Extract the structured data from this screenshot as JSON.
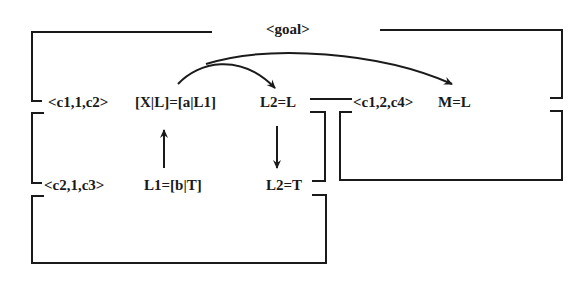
{
  "diagram": {
    "goal_label": "<goal>",
    "row1": {
      "clause1": "<c1,1,c2>",
      "unify1": "[X|L]=[a|L1]",
      "binding1": "L2=L",
      "clause2": "<c1,2,c4>",
      "binding2": "M=L"
    },
    "row2": {
      "clause": "<c2,1,c3>",
      "binding1": "L1=[b|T]",
      "binding2": "L2=T"
    },
    "colors": {
      "stroke": "#1a1a1a",
      "background": "#ffffff"
    }
  }
}
